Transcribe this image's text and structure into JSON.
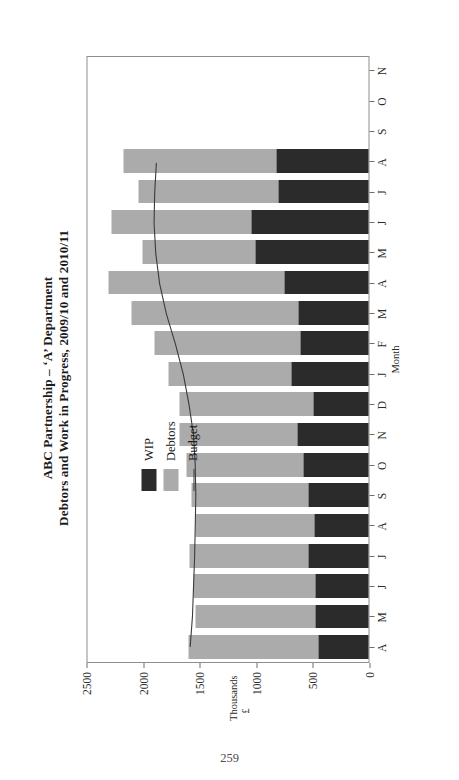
{
  "page": {
    "number": "259"
  },
  "figure": {
    "title_line1": "ABC Partnership – ‘A’ Department",
    "title_line2": "Debtors and Work in Progress, 2009/10 and 2010/11"
  },
  "legend": {
    "position": "inside-top-right",
    "items": [
      {
        "label": "WIP",
        "swatch": "wip",
        "color": "#2b2b2b"
      },
      {
        "label": "Debtors",
        "swatch": "debtor",
        "color": "#ababab"
      },
      {
        "label": "Budget",
        "swatch": "line",
        "color": "#3a3a3a"
      }
    ]
  },
  "colors": {
    "wip": "#2b2b2b",
    "debtors": "#ababab",
    "budget_line": "#3a3a3a",
    "frame": "#8d8d8d",
    "background": "#ffffff"
  },
  "chart_data": {
    "type": "bar",
    "subtype": "stacked-column",
    "xlabel": "Month",
    "ylabel": "Thousands",
    "yunit": "£",
    "ylim": [
      0,
      2500
    ],
    "yticks": [
      0,
      500,
      1000,
      1500,
      2000,
      2500
    ],
    "ytick_labels": [
      "0",
      "500",
      "1000",
      "1500",
      "2000",
      "2500"
    ],
    "grid": false,
    "categories": [
      "A",
      "M",
      "J",
      "J",
      "A",
      "S",
      "O",
      "N",
      "D",
      "J",
      "F",
      "M",
      "A",
      "M",
      "J",
      "J",
      "A",
      "S",
      "O",
      "N"
    ],
    "series": [
      {
        "name": "WIP",
        "color": "#2b2b2b",
        "values": [
          440,
          470,
          470,
          530,
          475,
          530,
          575,
          625,
          490,
          680,
          600,
          620,
          740,
          995,
          1030,
          795,
          810,
          null,
          null,
          null
        ]
      },
      {
        "name": "Debtors",
        "color": "#ababab",
        "values": [
          1150,
          1055,
          1075,
          1055,
          1055,
          1030,
          1035,
          1045,
          1180,
          1085,
          1290,
          1470,
          1560,
          1005,
          1240,
          1235,
          1355,
          null,
          null,
          null
        ]
      },
      {
        "name": "Budget",
        "color": "#3a3a3a",
        "type": "line",
        "values": [
          1590,
          1570,
          1560,
          1550,
          1545,
          1540,
          1545,
          1560,
          1600,
          1650,
          1720,
          1800,
          1860,
          1895,
          1910,
          1905,
          1890,
          null,
          null,
          null
        ]
      }
    ],
    "totals": [
      1590,
      1525,
      1545,
      1585,
      1530,
      1560,
      1610,
      1670,
      1670,
      1765,
      1890,
      2090,
      2300,
      2000,
      2270,
      2030,
      2165,
      null,
      null,
      null
    ]
  }
}
